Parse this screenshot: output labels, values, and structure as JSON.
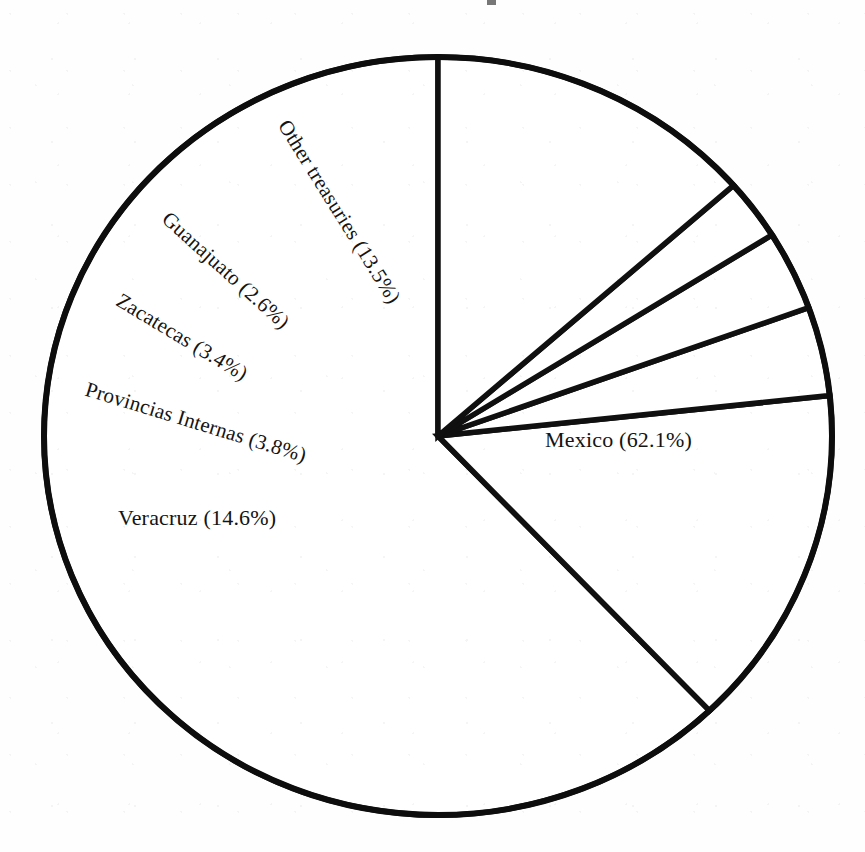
{
  "figure": {
    "background_color": "#fefefe",
    "ink_color": "#101010",
    "center_x": 438,
    "center_y": 436,
    "radius_x": 394,
    "radius_y": 379
  },
  "chart_data": {
    "type": "pie",
    "title": "",
    "subtitle": "",
    "xlabel": "",
    "ylabel": "",
    "legend_position": "none",
    "grid": false,
    "start_angle_deg": 0,
    "direction": "counterclockwise",
    "units": "percent",
    "categories": [
      "Mexico",
      "Veracruz",
      "Provincias Internas",
      "Zacatecas",
      "Guanajuato",
      "Other treasuries"
    ],
    "values": [
      62.1,
      14.6,
      3.8,
      3.4,
      2.6,
      13.5
    ],
    "labels": [
      "Mexico (62.1%)",
      "Veracruz (14.6%)",
      "Provincias Internas (3.8%)",
      "Zacatecas (3.4%)",
      "Guanajuato (2.6%)",
      "Other treasuries (13.5%)"
    ],
    "slice_fill": "#ffffff",
    "slice_stroke": "#101010"
  },
  "slices": [
    {
      "name": "mexico",
      "label": "Mexico (62.1%)",
      "value": 62.1,
      "start_deg": 0,
      "sweep_deg": 223.56,
      "label_x": 545,
      "label_y": 440,
      "label_rotation": 0
    },
    {
      "name": "veracruz",
      "label": "Veracruz (14.6%)",
      "value": 14.6,
      "start_deg": 223.56,
      "sweep_deg": 52.56,
      "label_x": 118,
      "label_y": 518,
      "label_rotation": 0
    },
    {
      "name": "provincias-internas",
      "label": "Provincias Internas (3.8%)",
      "value": 3.8,
      "start_deg": 276.12,
      "sweep_deg": 13.68,
      "label_x": 86,
      "label_y": 389,
      "label_rotation": 17
    },
    {
      "name": "zacatecas",
      "label": "Zacatecas (3.4%)",
      "value": 3.4,
      "start_deg": 289.8,
      "sweep_deg": 12.24,
      "label_x": 118,
      "label_y": 299,
      "label_rotation": 31
    },
    {
      "name": "guanajuato",
      "label": "Guanajuato (2.6%)",
      "value": 2.6,
      "start_deg": 302.04,
      "sweep_deg": 9.36,
      "label_x": 165,
      "label_y": 216,
      "label_rotation": 42
    },
    {
      "name": "other-treasuries",
      "label": "Other treasuries (13.5%)",
      "value": 13.5,
      "start_deg": 311.4,
      "sweep_deg": 48.6,
      "label_x": 283,
      "label_y": 122,
      "label_rotation": 58
    }
  ]
}
